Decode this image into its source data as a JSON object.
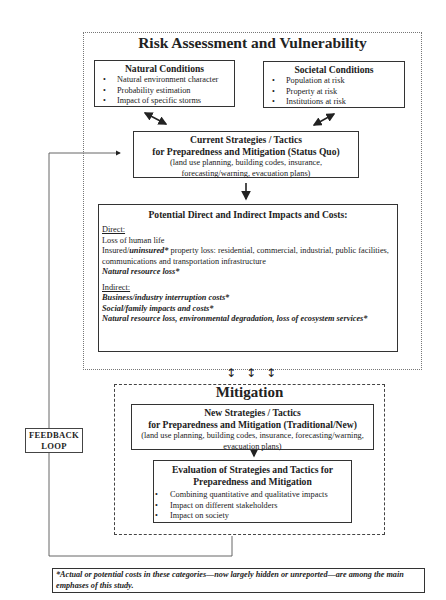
{
  "risk_section": {
    "title": "Risk Assessment and Vulnerability",
    "natural_conditions": {
      "heading": "Natural Conditions",
      "items": [
        "Natural environment character",
        "Probability estimation",
        "Impact of specific storms"
      ]
    },
    "societal_conditions": {
      "heading": "Societal Conditions",
      "items": [
        "Population at risk",
        "Property at risk",
        "Institutions at risk"
      ]
    },
    "current_strategies": {
      "heading_line1": "Current Strategies / Tactics",
      "heading_line2": "for Preparedness and Mitigation (Status Quo)",
      "detail_line1": "(land use planning, building codes, insurance,",
      "detail_line2": "forecasting/warning, evacuation plans)"
    },
    "impacts": {
      "heading": "Potential Direct and Indirect Impacts and Costs:",
      "direct_label": "Direct:",
      "direct_items": {
        "loss_of_life": "Loss of human life",
        "property_prefix": "Insured/",
        "property_emph": "uninsured*",
        "property_rest": " property loss: residential, commercial, industrial, public facilities, communications and transportation infrastructure",
        "natural_resource": "Natural resource loss*"
      },
      "indirect_label": "Indirect:",
      "indirect_items": [
        "Business/industry interruption costs*",
        "Social/family impacts and costs*",
        "Natural resource loss, environmental degradation, loss of ecosystem services*"
      ]
    }
  },
  "connector_arrows": [
    "↕",
    "↕",
    "↕"
  ],
  "mitigation_section": {
    "title": "Mitigation",
    "new_strategies": {
      "heading_line1": "New Strategies / Tactics",
      "heading_line2": "for Preparedness and Mitigation (Traditional/New)",
      "detail_line1": "(land use planning, building codes, insurance, forecasting/warning,",
      "detail_line2": "evacuation plans)"
    },
    "evaluation": {
      "heading_line1": "Evaluation of Strategies and Tactics for",
      "heading_line2": "Preparedness and Mitigation",
      "items": [
        "Combining quantitative and qualitative impacts",
        "Impact on different stakeholders",
        "Impact on society"
      ]
    }
  },
  "feedback_loop": {
    "line1": "FEEDBACK",
    "line2": "LOOP"
  },
  "footnote": "*Actual or potential costs in these categories—now largely hidden or unreported—are among the main emphases of this study."
}
